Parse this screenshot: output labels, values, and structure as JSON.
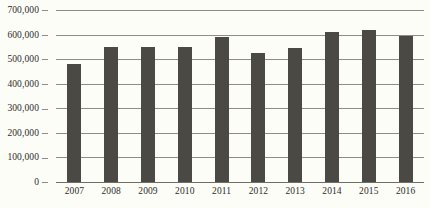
{
  "chart_data": {
    "type": "bar",
    "title": "",
    "xlabel": "",
    "ylabel": "",
    "categories": [
      "2007",
      "2008",
      "2009",
      "2010",
      "2011",
      "2012",
      "2013",
      "2014",
      "2015",
      "2016"
    ],
    "values": [
      480000,
      550000,
      550000,
      550000,
      590000,
      525000,
      545000,
      610000,
      620000,
      595000
    ],
    "ylim": [
      0,
      700000
    ],
    "ytick_values": [
      0,
      100000,
      200000,
      300000,
      400000,
      500000,
      600000,
      700000
    ],
    "ytick_labels": [
      "0",
      "100,000",
      "200,000",
      "300,000",
      "400,000",
      "500,000",
      "600,000",
      "700,000"
    ],
    "grid": true,
    "legend": false,
    "bar_color": "#4a4944",
    "grid_color": "#8d8d86",
    "background_color": "#fdfdf8"
  }
}
